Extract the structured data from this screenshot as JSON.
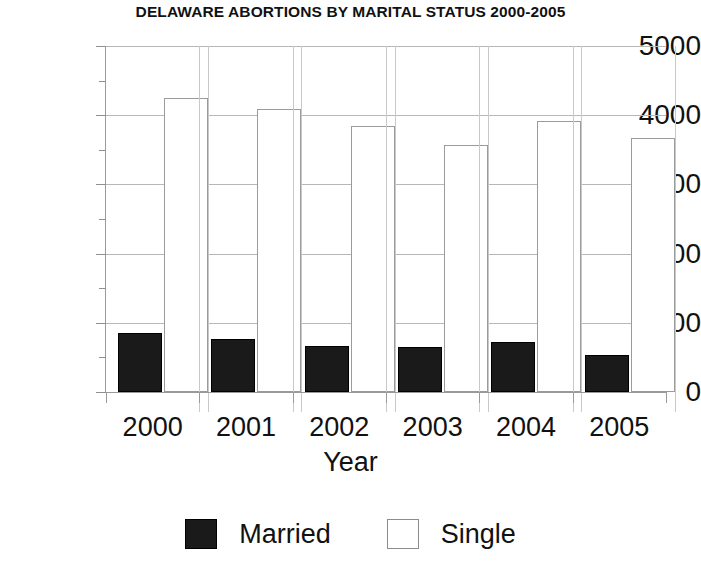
{
  "chart_data": {
    "type": "bar",
    "title": "DELAWARE ABORTIONS BY MARITAL STATUS 2000-2005",
    "xlabel": "Year",
    "ylabel": "",
    "categories": [
      "2000",
      "2001",
      "2002",
      "2003",
      "2004",
      "2005"
    ],
    "series": [
      {
        "name": "Married",
        "color": "#1a1a1a",
        "values": [
          850,
          770,
          660,
          650,
          720,
          540
        ]
      },
      {
        "name": "Single",
        "color": "#ffffff",
        "values": [
          4250,
          4090,
          3850,
          3570,
          3910,
          3670
        ]
      }
    ],
    "ylim": [
      0,
      5000
    ],
    "yticks": [
      "0",
      "1000",
      "2000",
      "3000",
      "4000",
      "5000"
    ],
    "ytick_values": [
      0,
      1000,
      2000,
      3000,
      4000,
      5000
    ],
    "minor_tick_values": [
      500,
      1500,
      2500,
      3500,
      4500
    ],
    "grid": true,
    "legend_position": "bottom",
    "legend": [
      "Married",
      "Single"
    ]
  }
}
